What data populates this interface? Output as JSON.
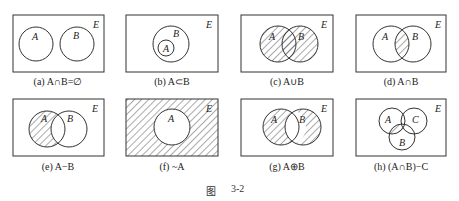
{
  "figure": {
    "caption_prefix": "图",
    "caption_number": "3-2",
    "universe_label": "E",
    "hatch_color": "#555555",
    "line_color": "#333333"
  },
  "panels": [
    {
      "id": "a",
      "label": "(a) A∩B=∅",
      "sets": [
        "A",
        "B"
      ],
      "shaded": "none",
      "relation": "disjoint"
    },
    {
      "id": "b",
      "label": "(b) A⊂B",
      "sets": [
        "A",
        "B"
      ],
      "shaded": "none",
      "relation": "subset"
    },
    {
      "id": "c",
      "label": "(c) A∪B",
      "sets": [
        "A",
        "B"
      ],
      "shaded": "union"
    },
    {
      "id": "d",
      "label": "(d) A∩B",
      "sets": [
        "A",
        "B"
      ],
      "shaded": "intersection"
    },
    {
      "id": "e",
      "label": "(e) A−B",
      "sets": [
        "A",
        "B"
      ],
      "shaded": "difference"
    },
    {
      "id": "f",
      "label": "(f) ~A",
      "sets": [
        "A"
      ],
      "shaded": "complement"
    },
    {
      "id": "g",
      "label": "(g) A⊕B",
      "sets": [
        "A",
        "B"
      ],
      "shaded": "symmetric-difference"
    },
    {
      "id": "h",
      "label": "(h) (A∩B)−C",
      "sets": [
        "A",
        "B",
        "C"
      ],
      "shaded": "intersection-minus-C"
    }
  ]
}
